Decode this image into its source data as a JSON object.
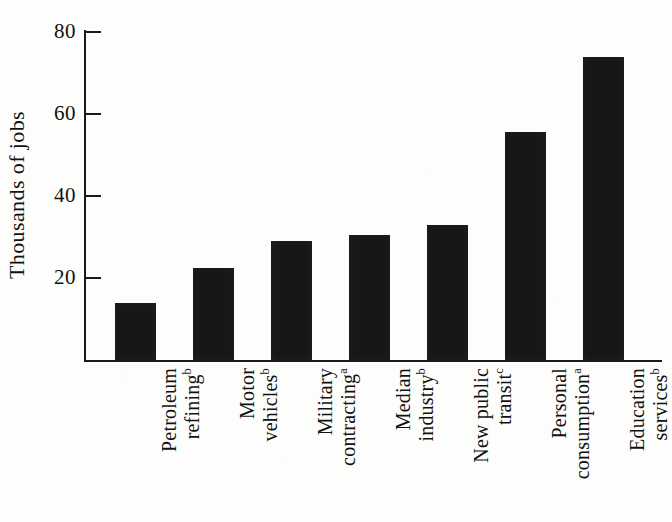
{
  "chart_data": {
    "type": "bar",
    "title": "",
    "subtitle": "",
    "xlabel": "",
    "ylabel": "Thousands of jobs",
    "ylim": [
      0,
      85
    ],
    "yticks": [
      20,
      40,
      60,
      80
    ],
    "ytick_labels": [
      "20",
      "40",
      "60",
      "80"
    ],
    "grid": false,
    "legend": null,
    "orientation": "vertical",
    "bar_color": "#171717",
    "categories": [
      "Petroleum refining",
      "Motor vehicles",
      "Military contracting",
      "Median industry",
      "New public transit",
      "Personal consumption",
      "Education services"
    ],
    "category_footnotes": [
      "b",
      "b",
      "a",
      "b",
      "c",
      "a",
      "b"
    ],
    "category_lines": [
      [
        "Petroleum",
        "refining"
      ],
      [
        "Motor",
        "vehicles"
      ],
      [
        "Military",
        "contracting"
      ],
      [
        "Median",
        "industry"
      ],
      [
        "New public",
        "transit"
      ],
      [
        "Personal",
        "consumption"
      ],
      [
        "Education",
        "services"
      ]
    ],
    "values": [
      14,
      22.5,
      29,
      30.5,
      33,
      55.5,
      74
    ]
  },
  "axis": {
    "y_title": "Thousands of jobs",
    "ticks": [
      {
        "label": "80",
        "value": 80
      },
      {
        "label": "60",
        "value": 60
      },
      {
        "label": "40",
        "value": 40
      },
      {
        "label": "20",
        "value": 20
      }
    ]
  },
  "bars": [
    {
      "line1": "Petroleum",
      "line2": "refining",
      "footnote": "b",
      "value": 14
    },
    {
      "line1": "Motor",
      "line2": "vehicles",
      "footnote": "b",
      "value": 22.5
    },
    {
      "line1": "Military",
      "line2": "contracting",
      "footnote": "a",
      "value": 29
    },
    {
      "line1": "Median",
      "line2": "industry",
      "footnote": "b",
      "value": 30.5
    },
    {
      "line1": "New public",
      "line2": "transit",
      "footnote": "c",
      "value": 33
    },
    {
      "line1": "Personal",
      "line2": "consumption",
      "footnote": "a",
      "value": 55.5
    },
    {
      "line1": "Education",
      "line2": "services",
      "footnote": "b",
      "value": 74
    }
  ]
}
